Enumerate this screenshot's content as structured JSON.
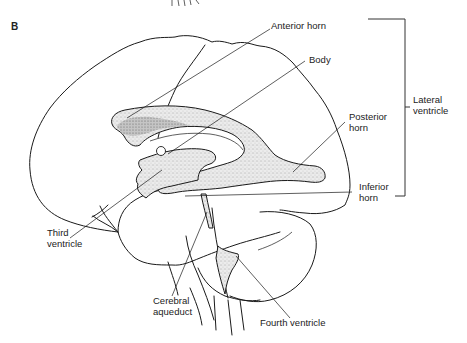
{
  "figure": {
    "panel_label": "B"
  },
  "labels": {
    "anterior_horn": "Anterior horn",
    "body": "Body",
    "posterior_horn": [
      "Posterior",
      "horn"
    ],
    "inferior_horn": [
      "Inferior",
      "horn"
    ],
    "lateral_ventricle": [
      "Lateral",
      "ventricle"
    ],
    "third_ventricle": [
      "Third",
      "ventricle"
    ],
    "cerebral_aqueduct": [
      "Cerebral",
      "aqueduct"
    ],
    "fourth_ventricle": "Fourth ventricle"
  },
  "groups": {
    "lateral_ventricle_parts": [
      "Anterior horn",
      "Body",
      "Posterior horn",
      "Inferior horn"
    ]
  },
  "colors": {
    "line": "#1a1a1a",
    "ventricle_fill": "#d9d9d9",
    "background": "#ffffff"
  }
}
